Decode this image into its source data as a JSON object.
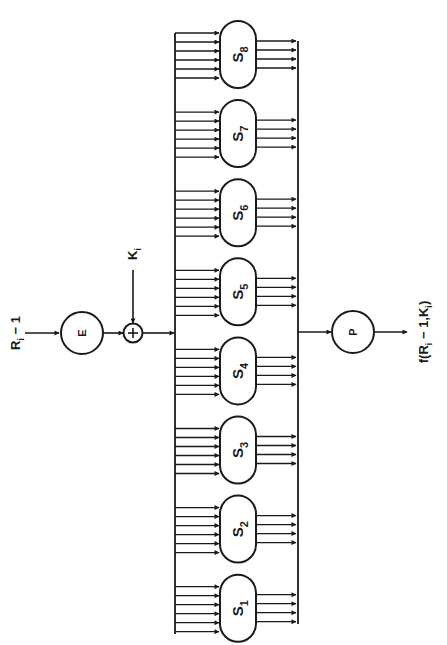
{
  "diagram": {
    "input_label": "R",
    "input_sub": "i",
    "input_suffix": " − 1",
    "key_label": "K",
    "key_sub": "i",
    "expansion_label": "E",
    "xor_symbol": "+",
    "permutation_label": "P",
    "output_label": {
      "prefix": "f(R",
      "sub1": "i",
      "mid": " − 1",
      "sep": ",K",
      "sub2": "i",
      "suffix": ")"
    },
    "sboxes": [
      {
        "name": "S",
        "index": "1"
      },
      {
        "name": "S",
        "index": "2"
      },
      {
        "name": "S",
        "index": "3"
      },
      {
        "name": "S",
        "index": "4"
      },
      {
        "name": "S",
        "index": "5"
      },
      {
        "name": "S",
        "index": "6"
      },
      {
        "name": "S",
        "index": "7"
      },
      {
        "name": "S",
        "index": "8"
      }
    ],
    "sbox_inputs_per_box": 6,
    "sbox_outputs_per_box": 4,
    "line_color": "#1a1a1a"
  }
}
